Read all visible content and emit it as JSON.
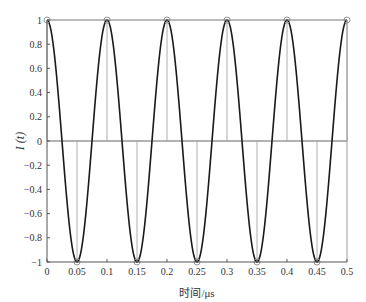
{
  "chart_data": {
    "type": "line",
    "title": "",
    "xlabel": "时间/μs",
    "ylabel": "I (t)",
    "xlim": [
      0,
      0.5
    ],
    "ylim": [
      -1,
      1
    ],
    "grid": false,
    "legend": null,
    "x_ticks": [
      "0",
      "0.05",
      "0.1",
      "0.15",
      "0.2",
      "0.25",
      "0.3",
      "0.35",
      "0.4",
      "0.45",
      "0.5"
    ],
    "y_ticks": [
      "1",
      "0.8",
      "0.6",
      "0.4",
      "0.2",
      "0",
      "−0.2",
      "−0.4",
      "−0.6",
      "−0.8",
      "−1"
    ],
    "series": [
      {
        "name": "I(t) continuous",
        "style": "line",
        "function": "cos(2π·10·t)",
        "period_us": 0.1,
        "color": "#1a1a1a"
      },
      {
        "name": "samples",
        "style": "stem",
        "marker": "circle",
        "color": "#9a9a9a",
        "x": [
          0,
          0.05,
          0.1,
          0.15,
          0.2,
          0.25,
          0.3,
          0.35,
          0.4,
          0.45,
          0.5
        ],
        "values": [
          1,
          -1,
          1,
          -1,
          1,
          -1,
          1,
          -1,
          1,
          -1,
          1
        ]
      }
    ]
  },
  "labels": {
    "xlabel": "时间/μs",
    "ylabel": "I (t)"
  }
}
